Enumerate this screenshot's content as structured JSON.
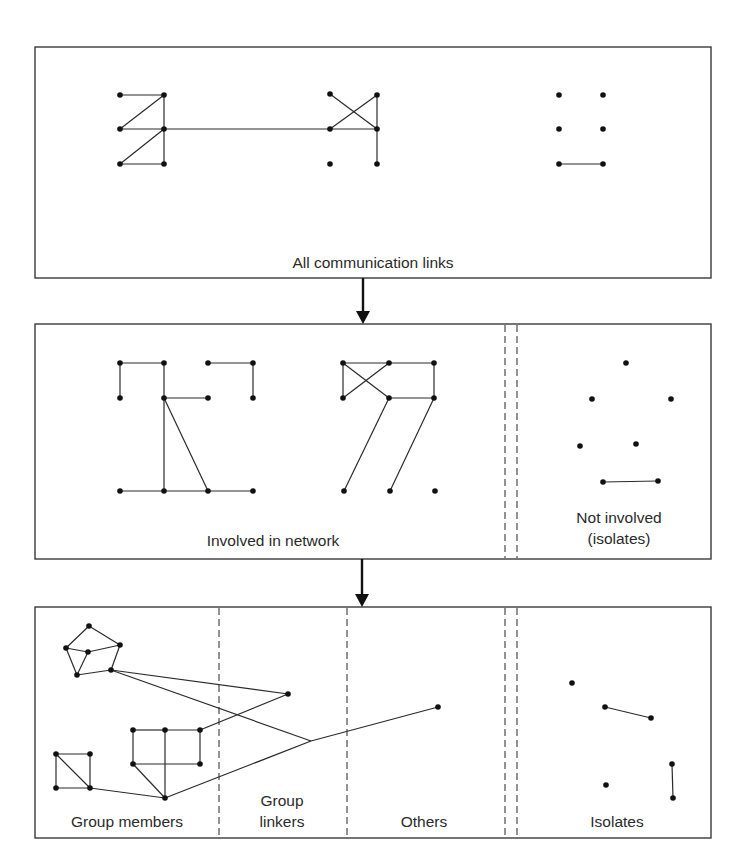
{
  "diagram": {
    "colors": {
      "ink": "#2a2a2a",
      "node": "#111111",
      "background": "#ffffff"
    },
    "panels": [
      {
        "id": "all-links",
        "frame": {
          "x": 35,
          "y": 47,
          "w": 676,
          "h": 231
        },
        "dividers": [],
        "labels": [
          {
            "lines": [
              "All communication links"
            ],
            "x": 373,
            "y": 268
          }
        ],
        "nodes": [
          [
            120,
            95
          ],
          [
            164,
            95
          ],
          [
            120,
            129
          ],
          [
            164,
            129
          ],
          [
            120,
            164
          ],
          [
            164,
            164
          ],
          [
            330,
            94
          ],
          [
            377,
            95
          ],
          [
            330,
            129
          ],
          [
            377,
            129
          ],
          [
            330,
            164
          ],
          [
            377,
            164
          ],
          [
            559,
            95
          ],
          [
            603,
            95
          ],
          [
            559,
            129
          ],
          [
            603,
            129
          ],
          [
            559,
            164
          ],
          [
            603,
            164
          ]
        ],
        "edges": [
          [
            0,
            1
          ],
          [
            1,
            2
          ],
          [
            1,
            3
          ],
          [
            2,
            3
          ],
          [
            3,
            4
          ],
          [
            3,
            5
          ],
          [
            4,
            5
          ],
          [
            3,
            8
          ],
          [
            6,
            9
          ],
          [
            7,
            8
          ],
          [
            7,
            9
          ],
          [
            8,
            9
          ],
          [
            9,
            11
          ],
          [
            16,
            17
          ]
        ]
      },
      {
        "id": "involvement",
        "frame": {
          "x": 35,
          "y": 324,
          "w": 676,
          "h": 235
        },
        "dividers": [
          505,
          517
        ],
        "labels": [
          {
            "lines": [
              "Involved in network"
            ],
            "x": 273,
            "y": 546
          },
          {
            "lines": [
              "Not involved",
              "(isolates)"
            ],
            "x": 619,
            "y": 523
          }
        ],
        "nodes": [
          [
            120,
            363
          ],
          [
            164,
            363
          ],
          [
            208,
            363
          ],
          [
            253,
            363
          ],
          [
            120,
            398
          ],
          [
            164,
            398
          ],
          [
            208,
            398
          ],
          [
            253,
            398
          ],
          [
            120,
            491
          ],
          [
            164,
            491
          ],
          [
            208,
            491
          ],
          [
            253,
            491
          ],
          [
            343,
            363
          ],
          [
            389,
            363
          ],
          [
            434,
            363
          ],
          [
            343,
            398
          ],
          [
            389,
            398
          ],
          [
            434,
            398
          ],
          [
            344,
            491
          ],
          [
            390,
            491
          ],
          [
            435,
            491
          ],
          [
            626,
            363
          ],
          [
            592,
            399
          ],
          [
            671,
            399
          ],
          [
            580,
            446
          ],
          [
            636,
            444
          ],
          [
            603,
            482
          ],
          [
            658,
            481
          ]
        ],
        "edges": [
          [
            0,
            1
          ],
          [
            0,
            4
          ],
          [
            1,
            5
          ],
          [
            5,
            6
          ],
          [
            2,
            3
          ],
          [
            3,
            7
          ],
          [
            5,
            9
          ],
          [
            5,
            10
          ],
          [
            8,
            9
          ],
          [
            9,
            10
          ],
          [
            10,
            11
          ],
          [
            12,
            13
          ],
          [
            13,
            14
          ],
          [
            12,
            15
          ],
          [
            12,
            16
          ],
          [
            15,
            13
          ],
          [
            14,
            17
          ],
          [
            16,
            17
          ],
          [
            16,
            18
          ],
          [
            17,
            19
          ],
          [
            26,
            27
          ]
        ]
      },
      {
        "id": "roles",
        "frame": {
          "x": 35,
          "y": 607,
          "w": 676,
          "h": 231
        },
        "dividers": [
          219,
          347,
          505,
          517
        ],
        "labels": [
          {
            "lines": [
              "Group members"
            ],
            "x": 127,
            "y": 827
          },
          {
            "lines": [
              "Group",
              "linkers"
            ],
            "x": 282,
            "y": 806
          },
          {
            "lines": [
              "Others"
            ],
            "x": 424,
            "y": 827
          },
          {
            "lines": [
              "Isolates"
            ],
            "x": 617,
            "y": 827
          }
        ],
        "nodes": [
          [
            89,
            626
          ],
          [
            66,
            648
          ],
          [
            88,
            652
          ],
          [
            120,
            645
          ],
          [
            77,
            675
          ],
          [
            111,
            670
          ],
          [
            56,
            754
          ],
          [
            90,
            754
          ],
          [
            56,
            788
          ],
          [
            90,
            788
          ],
          [
            133,
            730
          ],
          [
            165,
            730
          ],
          [
            200,
            730
          ],
          [
            133,
            764
          ],
          [
            200,
            764
          ],
          [
            165,
            798
          ],
          [
            288,
            694
          ],
          [
            311,
            741
          ],
          [
            438,
            707
          ],
          [
            572,
            683
          ],
          [
            605,
            707
          ],
          [
            651,
            718
          ],
          [
            606,
            785
          ],
          [
            672,
            764
          ],
          [
            673,
            798
          ]
        ],
        "edges": [
          [
            0,
            1
          ],
          [
            0,
            3
          ],
          [
            1,
            2
          ],
          [
            2,
            3
          ],
          [
            1,
            4
          ],
          [
            2,
            4
          ],
          [
            3,
            5
          ],
          [
            4,
            5
          ],
          [
            5,
            16
          ],
          [
            5,
            17
          ],
          [
            6,
            7
          ],
          [
            6,
            8
          ],
          [
            7,
            9
          ],
          [
            8,
            9
          ],
          [
            6,
            9
          ],
          [
            9,
            15
          ],
          [
            10,
            11
          ],
          [
            11,
            12
          ],
          [
            10,
            13
          ],
          [
            12,
            14
          ],
          [
            13,
            14
          ],
          [
            11,
            15
          ],
          [
            13,
            15
          ],
          [
            12,
            16
          ],
          [
            15,
            17
          ],
          [
            17,
            18
          ],
          [
            20,
            21
          ],
          [
            23,
            24
          ]
        ],
        "hidden_nodes": [
          17
        ]
      }
    ],
    "arrows": [
      {
        "x": 363,
        "y1": 278,
        "y2": 324
      },
      {
        "x": 362,
        "y1": 559,
        "y2": 607
      }
    ]
  }
}
